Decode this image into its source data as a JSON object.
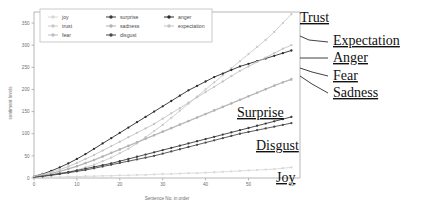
{
  "chart_data": {
    "type": "line",
    "title": "",
    "xlabel": "Sentence No. in order",
    "ylabel": "sentiment levels",
    "xlim": [
      0,
      62
    ],
    "ylim": [
      0,
      375
    ],
    "xticks": [
      0,
      10,
      20,
      30,
      40,
      50,
      60
    ],
    "yticks": [
      0,
      50,
      100,
      150,
      200,
      250,
      300,
      350
    ],
    "grid": false,
    "legend_position": "top-center",
    "x": [
      0,
      2,
      4,
      6,
      8,
      10,
      12,
      14,
      16,
      18,
      20,
      22,
      24,
      26,
      28,
      30,
      32,
      34,
      36,
      38,
      40,
      42,
      44,
      46,
      48,
      50,
      52,
      54,
      56,
      58,
      60
    ],
    "series": [
      {
        "name": "joy",
        "color": "#d8d8d8",
        "marker": "dot",
        "values": [
          1,
          1,
          2,
          2,
          3,
          3,
          4,
          4,
          5,
          5,
          6,
          6,
          7,
          7,
          8,
          9,
          9,
          10,
          11,
          11,
          12,
          13,
          14,
          15,
          16,
          17,
          18,
          19,
          20,
          22,
          24
        ]
      },
      {
        "name": "trust",
        "color": "#c9c9c9",
        "marker": "dot",
        "values": [
          3,
          5,
          8,
          11,
          14,
          18,
          24,
          30,
          38,
          46,
          56,
          66,
          78,
          92,
          106,
          120,
          136,
          152,
          168,
          184,
          200,
          216,
          232,
          248,
          264,
          280,
          296,
          312,
          330,
          350,
          370
        ]
      },
      {
        "name": "fear",
        "color": "#bdbdbd",
        "marker": "dot",
        "values": [
          3,
          6,
          10,
          15,
          20,
          26,
          33,
          40,
          48,
          56,
          64,
          72,
          80,
          88,
          96,
          104,
          112,
          120,
          128,
          136,
          144,
          152,
          160,
          168,
          176,
          184,
          192,
          200,
          208,
          216,
          224
        ]
      },
      {
        "name": "surprise",
        "color": "#3a3a3a",
        "marker": "dot",
        "values": [
          2,
          4,
          7,
          10,
          13,
          17,
          21,
          25,
          29,
          33,
          38,
          43,
          48,
          53,
          58,
          63,
          68,
          73,
          78,
          83,
          88,
          93,
          98,
          103,
          108,
          113,
          118,
          123,
          128,
          133,
          138
        ]
      },
      {
        "name": "sadness",
        "color": "#b2b2b2",
        "marker": "dot",
        "values": [
          3,
          6,
          10,
          15,
          21,
          27,
          34,
          41,
          49,
          57,
          65,
          73,
          81,
          89,
          97,
          105,
          113,
          121,
          129,
          137,
          145,
          153,
          161,
          169,
          177,
          185,
          193,
          201,
          209,
          216,
          222
        ]
      },
      {
        "name": "disgust",
        "color": "#4a4a4a",
        "marker": "dot",
        "values": [
          2,
          4,
          6,
          9,
          12,
          15,
          18,
          22,
          26,
          30,
          34,
          38,
          42,
          46,
          50,
          55,
          60,
          65,
          70,
          75,
          80,
          85,
          90,
          95,
          100,
          104,
          108,
          112,
          116,
          120,
          124
        ]
      },
      {
        "name": "anger",
        "color": "#2b2b2b",
        "marker": "dot",
        "values": [
          4,
          9,
          16,
          24,
          33,
          43,
          54,
          66,
          78,
          90,
          102,
          114,
          126,
          138,
          150,
          162,
          174,
          186,
          198,
          208,
          218,
          228,
          236,
          244,
          252,
          258,
          264,
          270,
          276,
          282,
          288
        ]
      },
      {
        "name": "expectation",
        "color": "#c4c4c4",
        "marker": "dot",
        "values": [
          4,
          8,
          13,
          19,
          26,
          34,
          43,
          52,
          62,
          72,
          82,
          92,
          102,
          112,
          122,
          134,
          146,
          158,
          170,
          182,
          194,
          206,
          218,
          230,
          242,
          252,
          262,
          272,
          282,
          292,
          300
        ]
      }
    ],
    "annotations": [
      {
        "label": "Trust",
        "x_px": 300,
        "y_px": 22
      },
      {
        "label": "Expectation",
        "x_px": 333,
        "y_px": 45
      },
      {
        "label": "Anger",
        "x_px": 333,
        "y_px": 62
      },
      {
        "label": "Fear",
        "x_px": 333,
        "y_px": 80
      },
      {
        "label": "Sadness",
        "x_px": 333,
        "y_px": 97
      },
      {
        "label": "Surprise",
        "x_px": 237,
        "y_px": 117
      },
      {
        "label": "Disgust",
        "x_px": 256,
        "y_px": 150
      },
      {
        "label": "Joy",
        "x_px": 276,
        "y_px": 182
      }
    ]
  },
  "legend": {
    "items": [
      {
        "label": "joy",
        "color": "#d8d8d8"
      },
      {
        "label": "trust",
        "color": "#c9c9c9"
      },
      {
        "label": "fear",
        "color": "#bdbdbd"
      },
      {
        "label": "surprise",
        "color": "#3a3a3a"
      },
      {
        "label": "sadness",
        "color": "#b2b2b2"
      },
      {
        "label": "disgust",
        "color": "#4a4a4a"
      },
      {
        "label": "anger",
        "color": "#2b2b2b"
      },
      {
        "label": "expectation",
        "color": "#c4c4c4"
      }
    ]
  }
}
